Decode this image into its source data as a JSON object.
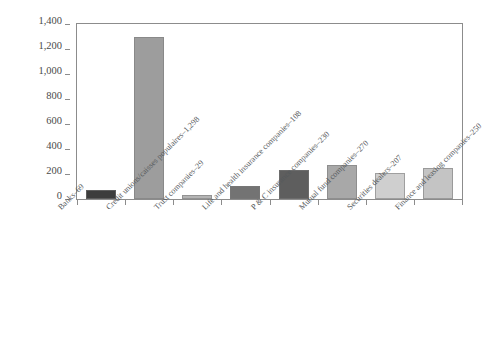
{
  "chart_data": {
    "type": "bar",
    "title": "",
    "subtitle": "",
    "xlabel": "",
    "ylabel": "",
    "ylim": [
      0,
      1400
    ],
    "grid": false,
    "legend": "none",
    "categories": [
      "Banks–69",
      "Credit unions/caisses populaires–1,298",
      "Trust companies–29",
      "Life and health insurance companies–108",
      "P & C insurance companies–230",
      "Mutual fund companies–270",
      "Securities dealers–207",
      "Finance and leasing companies–250"
    ],
    "values": [
      69,
      1298,
      29,
      108,
      230,
      270,
      207,
      250
    ],
    "bar_colors": [
      "#3d3d3d",
      "#9d9d9d",
      "#b4b4b4",
      "#737373",
      "#5e5e5e",
      "#a8a8a8",
      "#cfcfcf",
      "#c4c4c4"
    ],
    "y_ticks": [
      {
        "label": "1,400",
        "value": 1400
      },
      {
        "label": "1,200",
        "value": 1200
      },
      {
        "label": "1,000",
        "value": 1000
      },
      {
        "label": "800",
        "value": 800
      },
      {
        "label": "600",
        "value": 600
      },
      {
        "label": "400",
        "value": 400
      },
      {
        "label": "200",
        "value": 200
      },
      {
        "label": "0",
        "value": 0
      }
    ],
    "axis_color": "#8c8c8c",
    "text_color": "#4a4a4a"
  }
}
